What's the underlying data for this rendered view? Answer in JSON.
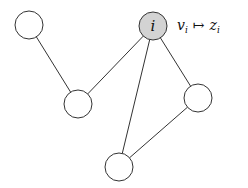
{
  "diagram": {
    "type": "graph",
    "colors": {
      "edge": "#333333",
      "node_stroke": "#333333",
      "node_fill": "#ffffff",
      "highlight_fill": "#d3d3d3",
      "background": "#ffffff"
    },
    "nodes": [
      {
        "id": "n1",
        "label": "",
        "cx": 29,
        "cy": 25,
        "r": 14,
        "highlighted": false
      },
      {
        "id": "i",
        "label": "i",
        "cx": 153,
        "cy": 26,
        "r": 14,
        "highlighted": true
      },
      {
        "id": "n3",
        "label": "",
        "cx": 78,
        "cy": 104,
        "r": 14,
        "highlighted": false
      },
      {
        "id": "n4",
        "label": "",
        "cx": 198,
        "cy": 98,
        "r": 14,
        "highlighted": false
      },
      {
        "id": "n5",
        "label": "",
        "cx": 119,
        "cy": 167,
        "r": 14,
        "highlighted": false
      }
    ],
    "edges": [
      {
        "from": "n1",
        "to": "n3"
      },
      {
        "from": "i",
        "to": "n3"
      },
      {
        "from": "i",
        "to": "n5"
      },
      {
        "from": "i",
        "to": "n4"
      },
      {
        "from": "n4",
        "to": "n5"
      }
    ],
    "annotation": {
      "v": "v",
      "v_sub": "i",
      "arrow": "↦",
      "z": "z",
      "z_sub": "i",
      "text": "v_i ↦ z_i"
    }
  }
}
